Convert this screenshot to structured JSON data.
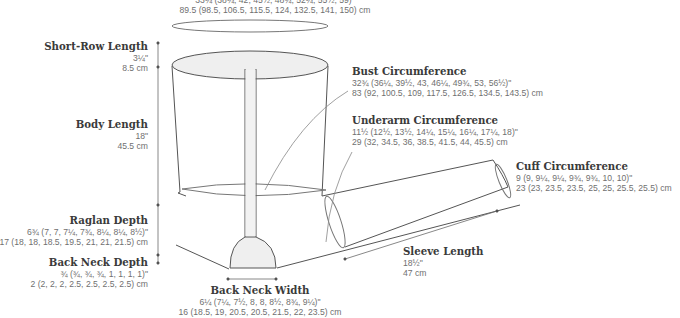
{
  "diagram": {
    "type": "garment-schematic",
    "colors": {
      "outline": "#555555",
      "fill_shade": "#efefef",
      "title_text": "#3a3a3a",
      "value_text": "#707070",
      "dim_line": "#6a6a6a"
    }
  },
  "labels": {
    "top_partial": {
      "line1": "33¼ (38¼, 42, 45½, 48¾, 52¼, 55½, 59)\"",
      "line2": "89.5 (98.5, 106.5, 115.5, 124, 132.5, 141, 150) cm"
    },
    "short_row_length": {
      "title": "Short-Row Length",
      "imperial": "3¼\"",
      "metric": "8.5 cm"
    },
    "body_length": {
      "title": "Body Length",
      "imperial": "18\"",
      "metric": "45.5 cm"
    },
    "raglan_depth": {
      "title": "Raglan Depth",
      "imperial": "6¾ (7, 7, 7¼, 7¾, 8¼, 8¼, 8½)\"",
      "metric": "17 (18, 18, 18.5, 19.5, 21, 21, 21.5) cm"
    },
    "back_neck_depth": {
      "title": "Back Neck Depth",
      "imperial": "¾ (¾, ¾, ¾, 1, 1, 1, 1)\"",
      "metric": "2 (2, 2, 2, 2.5, 2.5, 2.5, 2.5) cm"
    },
    "back_neck_width": {
      "title": "Back Neck Width",
      "imperial": "6¼ (7¼, 7½, 8, 8, 8½, 8¾, 9¼)\"",
      "metric": "16 (18.5, 19, 20.5, 20.5, 21.5, 22, 23.5) cm"
    },
    "bust_circumference": {
      "title": "Bust Circumference",
      "imperial": "32¾ (36¼, 39½, 43, 46¼, 49¾, 53, 56½)\"",
      "metric": "83 (92, 100.5, 109, 117.5, 126.5, 134.5, 143.5) cm"
    },
    "underarm_circumference": {
      "title": "Underarm Circumference",
      "imperial": "11½ (12½, 13½, 14¼, 15¼, 16¼, 17¼, 18)\"",
      "metric": "29 (32, 34.5, 36, 38.5, 41.5, 44, 45.5) cm"
    },
    "cuff_circumference": {
      "title": "Cuff Circumference",
      "imperial": "9 (9, 9¼, 9¼, 9¾, 9¾, 10, 10)\"",
      "metric": "23 (23, 23.5, 23.5, 25, 25, 25.5, 25.5) cm"
    },
    "sleeve_length": {
      "title": "Sleeve Length",
      "imperial": "18½\"",
      "metric": "47 cm"
    }
  }
}
